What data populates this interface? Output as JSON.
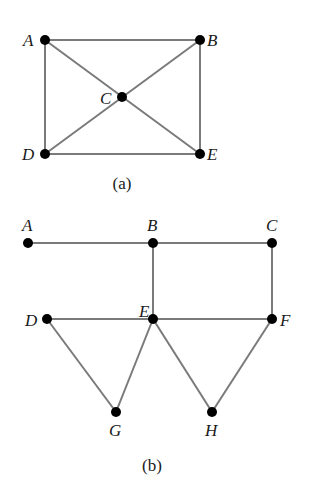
{
  "diagrams": [
    {
      "id": "a",
      "caption": "(a)",
      "caption_pos": [
        122,
        189
      ],
      "nodes": [
        {
          "label": "A",
          "x": 45,
          "y": 40,
          "lx": 23,
          "ly": 46
        },
        {
          "label": "B",
          "x": 200,
          "y": 40,
          "lx": 207,
          "ly": 46
        },
        {
          "label": "C",
          "x": 122,
          "y": 97,
          "lx": 100,
          "ly": 104
        },
        {
          "label": "D",
          "x": 45,
          "y": 154,
          "lx": 22,
          "ly": 160
        },
        {
          "label": "E",
          "x": 200,
          "y": 154,
          "lx": 207,
          "ly": 160
        }
      ],
      "edges": [
        [
          "A",
          "B"
        ],
        [
          "A",
          "D"
        ],
        [
          "B",
          "E"
        ],
        [
          "D",
          "E"
        ],
        [
          "A",
          "E"
        ],
        [
          "B",
          "D"
        ]
      ]
    },
    {
      "id": "b",
      "caption": "(b)",
      "caption_pos": [
        152,
        471
      ],
      "nodes": [
        {
          "label": "A",
          "x": 28,
          "y": 243,
          "lx": 22,
          "ly": 231
        },
        {
          "label": "B",
          "x": 153,
          "y": 243,
          "lx": 147,
          "ly": 231
        },
        {
          "label": "C",
          "x": 272,
          "y": 243,
          "lx": 266,
          "ly": 231
        },
        {
          "label": "D",
          "x": 47,
          "y": 319,
          "lx": 25,
          "ly": 326
        },
        {
          "label": "E",
          "x": 153,
          "y": 319,
          "lx": 139,
          "ly": 317
        },
        {
          "label": "F",
          "x": 272,
          "y": 319,
          "lx": 280,
          "ly": 326
        },
        {
          "label": "G",
          "x": 116,
          "y": 412,
          "lx": 109,
          "ly": 436
        },
        {
          "label": "H",
          "x": 212,
          "y": 412,
          "lx": 205,
          "ly": 436
        }
      ],
      "edges": [
        [
          "A",
          "B"
        ],
        [
          "B",
          "C"
        ],
        [
          "B",
          "E"
        ],
        [
          "C",
          "F"
        ],
        [
          "D",
          "E"
        ],
        [
          "E",
          "F"
        ],
        [
          "D",
          "G"
        ],
        [
          "G",
          "E"
        ],
        [
          "E",
          "H"
        ],
        [
          "H",
          "F"
        ]
      ]
    }
  ]
}
